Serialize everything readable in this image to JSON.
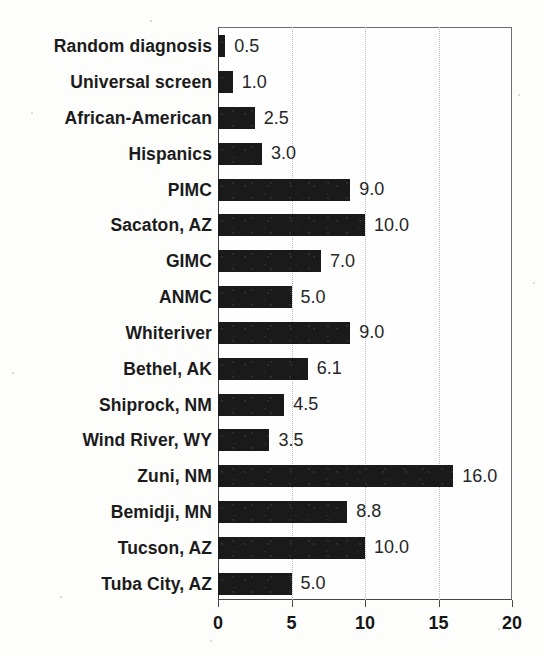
{
  "chart_data": {
    "type": "bar",
    "orientation": "horizontal",
    "title": "",
    "subtitle": "",
    "xlabel": "",
    "ylabel": "",
    "xlim": [
      0,
      20
    ],
    "xticks": [
      "0",
      "5",
      "10",
      "15",
      "20"
    ],
    "xtick_values": [
      0,
      5,
      10,
      15,
      20
    ],
    "gridlines": {
      "vertical": true,
      "horizontal": false,
      "style": "dotted",
      "at": [
        5,
        10,
        15
      ]
    },
    "legend": {
      "visible": false,
      "entries": []
    },
    "bar_color": "#1a1a1a",
    "value_labels_shown": true,
    "categories": [
      "Random diagnosis",
      "Universal screen",
      "African-American",
      "Hispanics",
      "PIMC",
      "Sacaton, AZ",
      "GIMC",
      "ANMC",
      "Whiteriver",
      "Bethel, AK",
      "Shiprock, NM",
      "Wind River, WY",
      "Zuni, NM",
      "Bemidji, MN",
      "Tucson, AZ",
      "Tuba City, AZ"
    ],
    "values": [
      0.5,
      1.0,
      2.5,
      3.0,
      9.0,
      10.0,
      7.0,
      5.0,
      9.0,
      6.1,
      4.5,
      3.5,
      16.0,
      8.8,
      10.0,
      5.0
    ],
    "value_labels": [
      "0.5",
      "1.0",
      "2.5",
      "3.0",
      "9.0",
      "10.0",
      "7.0",
      "5.0",
      "9.0",
      "6.1",
      "4.5",
      "3.5",
      "16.0",
      "8.8",
      "10.0",
      "5.0"
    ]
  }
}
